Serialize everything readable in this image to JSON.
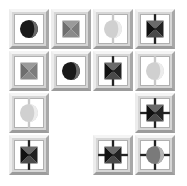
{
  "game": {
    "grid": {
      "rows": 4,
      "cols": 4,
      "tile_size": 40,
      "spacing": 42,
      "origin": [
        9,
        9
      ]
    },
    "colors": {
      "dark": "#1a1a1a",
      "mid": "#7a7a7a",
      "light": "#d0d0d0",
      "tile_face": "#d6d6d6",
      "tile_inner": "#ffffff"
    },
    "tiles": [
      {
        "row": 0,
        "col": 0,
        "shape": "circle",
        "shade": "dark",
        "pipes": "none"
      },
      {
        "row": 0,
        "col": 1,
        "shape": "hourglass",
        "shade": "mid",
        "pipes": "none"
      },
      {
        "row": 0,
        "col": 2,
        "shape": "circle",
        "shade": "light",
        "pipes": "vertical"
      },
      {
        "row": 0,
        "col": 3,
        "shape": "hourglass",
        "shade": "dark",
        "pipes": "vertical"
      },
      {
        "row": 1,
        "col": 0,
        "shape": "hourglass",
        "shade": "mid",
        "pipes": "none"
      },
      {
        "row": 1,
        "col": 1,
        "shape": "circle",
        "shade": "dark",
        "pipes": "none"
      },
      {
        "row": 1,
        "col": 2,
        "shape": "hourglass",
        "shade": "dark",
        "pipes": "vertical"
      },
      {
        "row": 1,
        "col": 3,
        "shape": "circle",
        "shade": "light",
        "pipes": "vertical"
      },
      {
        "row": 2,
        "col": 0,
        "shape": "circle",
        "shade": "light",
        "pipes": "vertical"
      },
      {
        "row": 2,
        "col": 3,
        "shape": "hourglass",
        "shade": "dark",
        "pipes": "cross"
      },
      {
        "row": 3,
        "col": 0,
        "shape": "hourglass",
        "shade": "dark",
        "pipes": "vertical"
      },
      {
        "row": 3,
        "col": 2,
        "shape": "hourglass",
        "shade": "dark",
        "pipes": "cross"
      },
      {
        "row": 3,
        "col": 3,
        "shape": "circle",
        "shade": "mid",
        "pipes": "cross"
      }
    ]
  }
}
